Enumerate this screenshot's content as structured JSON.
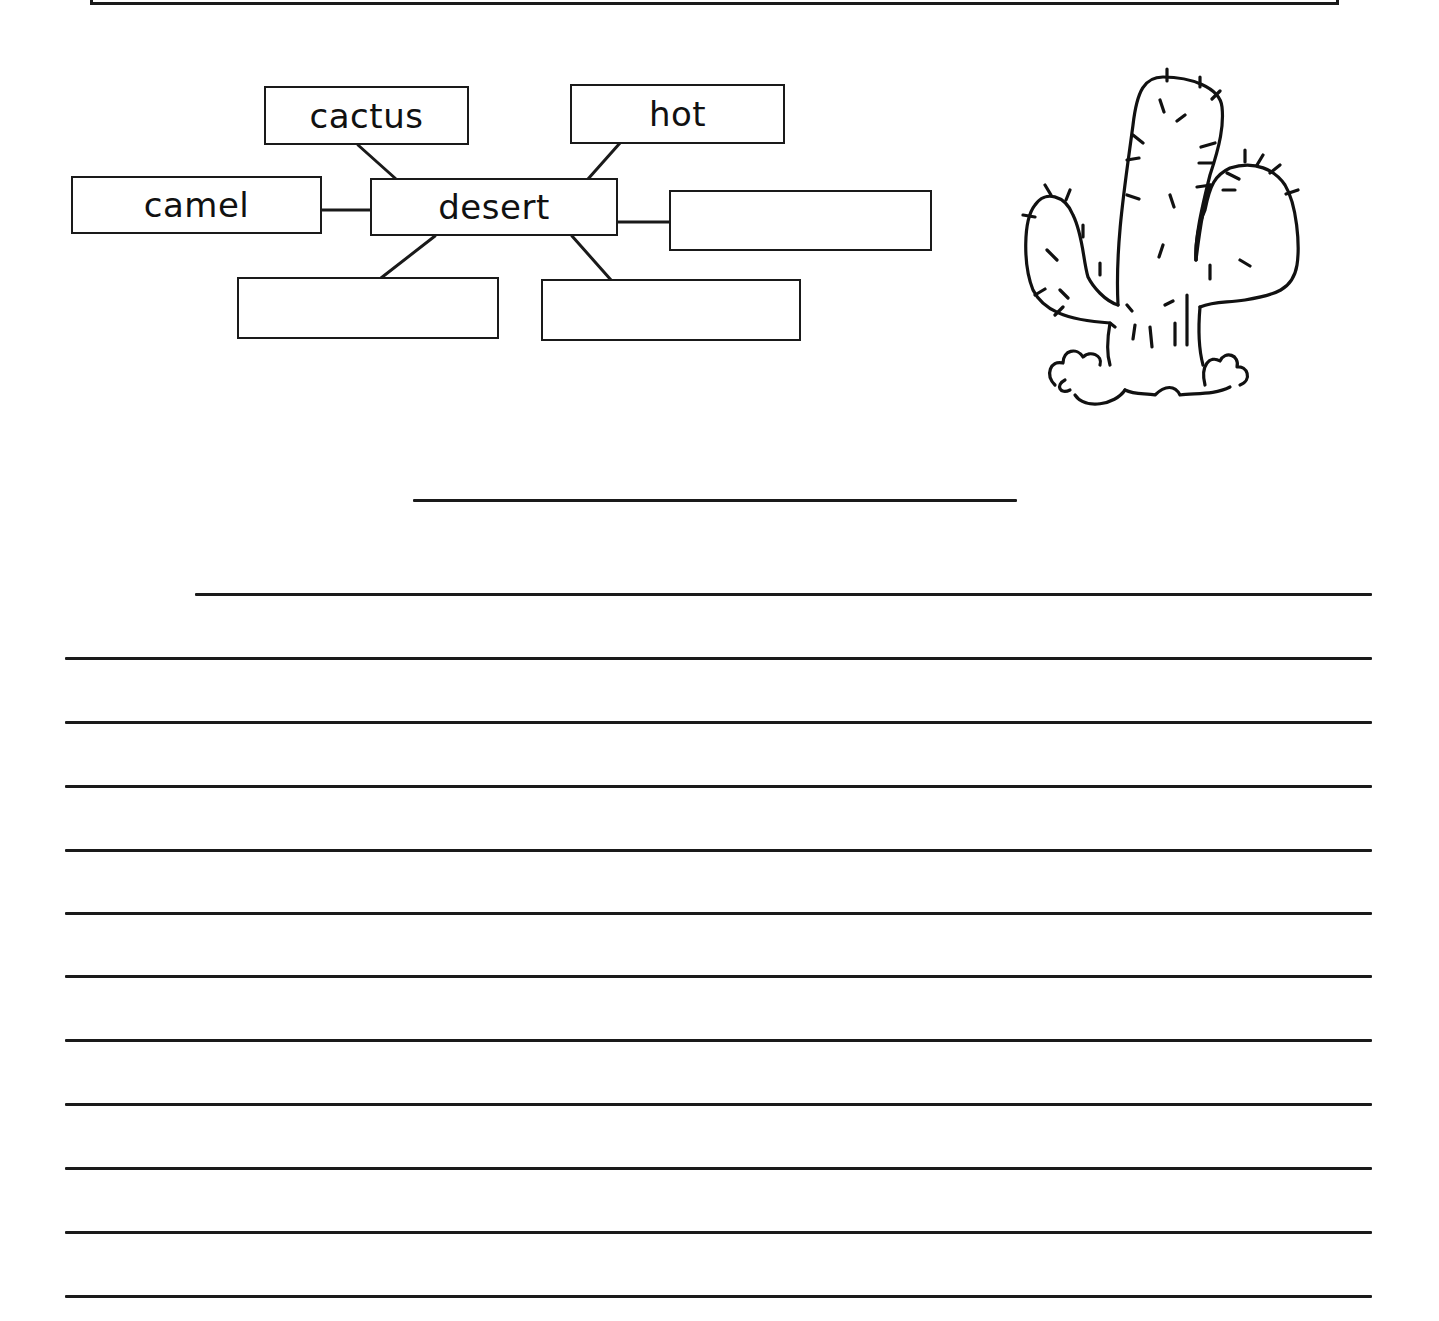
{
  "worksheet": {
    "word_web": {
      "center": {
        "label": "desert"
      },
      "nodes": [
        {
          "id": "cactus",
          "label": "cactus",
          "filled": true
        },
        {
          "id": "hot",
          "label": "hot",
          "filled": true
        },
        {
          "id": "camel",
          "label": "camel",
          "filled": true
        },
        {
          "id": "right",
          "label": "",
          "filled": false
        },
        {
          "id": "bottom-left",
          "label": "",
          "filled": false
        },
        {
          "id": "bottom-right",
          "label": "",
          "filled": false
        }
      ]
    },
    "illustration": {
      "subject": "cactus-icon"
    },
    "title_line": {
      "value": ""
    },
    "writing_lines": {
      "count": 12,
      "first_line_indented": true,
      "values": [
        "",
        "",
        "",
        "",
        "",
        "",
        "",
        "",
        "",
        "",
        "",
        ""
      ]
    },
    "colors": {
      "ink": "#1a1a1a",
      "paper": "#ffffff"
    }
  }
}
